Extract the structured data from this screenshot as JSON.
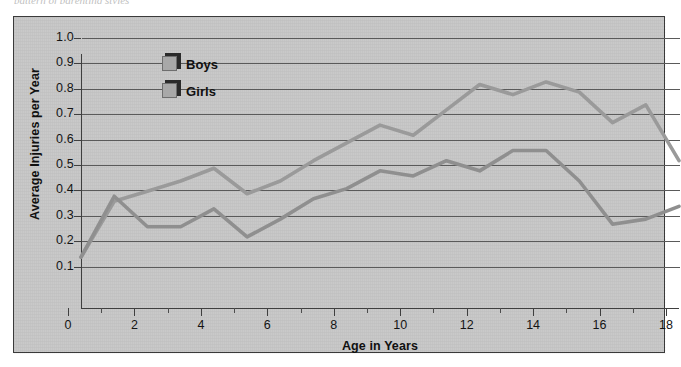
{
  "caption_sliver": "pattern of parenting styles",
  "chart_data": {
    "type": "line",
    "title": "",
    "xlabel": "Age in Years",
    "ylabel": "Average Injuries per Year",
    "xlim": [
      0,
      18
    ],
    "ylim": [
      0,
      1.0
    ],
    "grid": true,
    "legend_position": "upper-left-inside",
    "x_tick_labels": [
      "0",
      "2",
      "4",
      "6",
      "8",
      "10",
      "12",
      "14",
      "16",
      "18"
    ],
    "x_tick_values": [
      0,
      2,
      4,
      6,
      8,
      10,
      12,
      14,
      16,
      18
    ],
    "x_minor_tick_values": [
      1,
      3,
      5,
      7,
      9,
      11,
      13,
      15,
      17
    ],
    "y_tick_labels": [
      "0.1",
      "0.2",
      "0.3",
      "0.4",
      "0.5",
      "0.6",
      "0.7",
      "0.8",
      "0.9",
      "1.0"
    ],
    "y_tick_values": [
      0.1,
      0.2,
      0.3,
      0.4,
      0.5,
      0.6,
      0.7,
      0.8,
      0.9,
      1.0
    ],
    "x": [
      0,
      1,
      2,
      3,
      4,
      5,
      6,
      7,
      8,
      9,
      10,
      11,
      12,
      13,
      14,
      15,
      16,
      17,
      18
    ],
    "series": [
      {
        "name": "Boys",
        "color": "#9a9a9a",
        "values": [
          0.2,
          0.42,
          0.46,
          0.5,
          0.55,
          0.45,
          0.5,
          0.58,
          0.65,
          0.72,
          0.68,
          0.78,
          0.88,
          0.84,
          0.89,
          0.85,
          0.73,
          0.8,
          0.58
        ]
      },
      {
        "name": "Girls",
        "color": "#8f8f8f",
        "values": [
          0.2,
          0.44,
          0.32,
          0.32,
          0.39,
          0.28,
          0.35,
          0.43,
          0.47,
          0.54,
          0.52,
          0.58,
          0.54,
          0.62,
          0.62,
          0.5,
          0.33,
          0.35,
          0.4
        ]
      }
    ]
  },
  "legend": {
    "items": [
      {
        "label": "Boys"
      },
      {
        "label": "Girls"
      }
    ]
  },
  "colors": {
    "plot_background": "#c9c9c9",
    "frame_border": "#3b3b3b",
    "gridline": "#5a5a5a",
    "axis": "#3f3f3f",
    "series_line": "#9a9a9a",
    "text": "#111111"
  }
}
